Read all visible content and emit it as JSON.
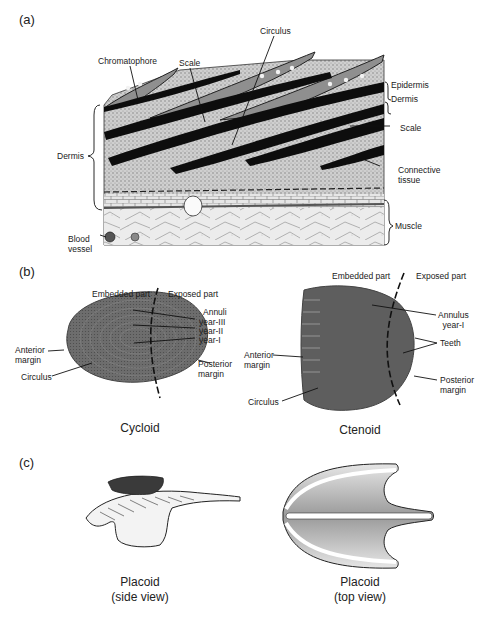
{
  "figure": {
    "panels": [
      {
        "id": "a",
        "label": "(a)",
        "labels": {
          "chromatophore": "Chromatophore",
          "scale_top": "Scale",
          "circulus": "Circulus",
          "epidermis": "Epidermis",
          "dermis_right": "Dermis",
          "scale_right": "Scale",
          "connective_line1": "Connective",
          "connective_line2": "tissue",
          "dermis_left": "Dermis",
          "muscle": "Muscle",
          "blood_line1": "Blood",
          "blood_line2": "vessel"
        }
      },
      {
        "id": "b",
        "label": "(b)",
        "cycloid": {
          "embedded": "Embedded part",
          "exposed": "Exposed part",
          "annuli": "Annuli",
          "year3": "year-III",
          "year2": "year-II",
          "year1": "year-I",
          "anterior_line1": "Anterior",
          "anterior_line2": "margin",
          "circulus": "Circulus",
          "posterior_line1": "Posterior",
          "posterior_line2": "margin",
          "caption": "Cycloid"
        },
        "ctenoid": {
          "embedded": "Embedded part",
          "exposed": "Exposed part",
          "annulus_line1": "Annulus",
          "annulus_line2": "year-I",
          "teeth": "Teeth",
          "anterior_line1": "Anterior",
          "anterior_line2": "margin",
          "circulus": "Circulus",
          "posterior_line1": "Posterior",
          "posterior_line2": "margin",
          "caption": "Ctenoid"
        }
      },
      {
        "id": "c",
        "label": "(c)",
        "side": {
          "caption_line1": "Placoid",
          "caption_line2": "(side view)"
        },
        "top": {
          "caption_line1": "Placoid",
          "caption_line2": "(top view)"
        }
      }
    ],
    "colors": {
      "ink": "#111111",
      "tissue": "#b5b5b5",
      "tissue_light": "#d9d9d9",
      "scale_fill": "#6e6e6e",
      "placoid_fill": "#c4c4c4"
    }
  }
}
